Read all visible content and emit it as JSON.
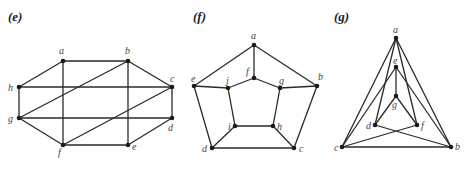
{
  "figures": [
    {
      "label": "(e)",
      "label_pos": [
        8,
        21
      ],
      "vertices": [
        {
          "id": "a",
          "x": 63,
          "y": 61,
          "lx": 59,
          "ly": 54
        },
        {
          "id": "b",
          "x": 128,
          "y": 61,
          "lx": 125,
          "ly": 54
        },
        {
          "id": "c",
          "x": 172,
          "y": 87,
          "lx": 170,
          "ly": 82
        },
        {
          "id": "d",
          "x": 172,
          "y": 118,
          "lx": 168,
          "ly": 131
        },
        {
          "id": "e",
          "x": 128,
          "y": 145,
          "lx": 132,
          "ly": 150
        },
        {
          "id": "f",
          "x": 63,
          "y": 145,
          "lx": 58,
          "ly": 156
        },
        {
          "id": "h",
          "x": 19,
          "y": 87,
          "lx": 8,
          "ly": 91
        },
        {
          "id": "g",
          "x": 19,
          "y": 118,
          "lx": 8,
          "ly": 122
        }
      ],
      "edges": [
        [
          "a",
          "b"
        ],
        [
          "a",
          "h"
        ],
        [
          "a",
          "f"
        ],
        [
          "b",
          "c"
        ],
        [
          "b",
          "e"
        ],
        [
          "b",
          "g"
        ],
        [
          "c",
          "h"
        ],
        [
          "c",
          "d"
        ],
        [
          "c",
          "f"
        ],
        [
          "d",
          "g"
        ],
        [
          "d",
          "e"
        ],
        [
          "e",
          "f"
        ],
        [
          "f",
          "g"
        ],
        [
          "g",
          "h"
        ]
      ]
    },
    {
      "label": "(f)",
      "label_pos": [
        193,
        21
      ],
      "vertices": [
        {
          "id": "a",
          "x": 254,
          "y": 45,
          "lx": 251,
          "ly": 39
        },
        {
          "id": "b",
          "x": 317,
          "y": 86,
          "lx": 318,
          "ly": 80
        },
        {
          "id": "c",
          "x": 294,
          "y": 148,
          "lx": 299,
          "ly": 152
        },
        {
          "id": "d",
          "x": 212,
          "y": 148,
          "lx": 202,
          "ly": 152
        },
        {
          "id": "e",
          "x": 194,
          "y": 86,
          "lx": 191,
          "ly": 82
        },
        {
          "id": "f",
          "x": 254,
          "y": 78,
          "lx": 246,
          "ly": 75
        },
        {
          "id": "g",
          "x": 280,
          "y": 88,
          "lx": 279,
          "ly": 84
        },
        {
          "id": "h",
          "x": 273,
          "y": 126,
          "lx": 277,
          "ly": 130
        },
        {
          "id": "i",
          "x": 235,
          "y": 126,
          "lx": 228,
          "ly": 130
        },
        {
          "id": "j",
          "x": 228,
          "y": 88,
          "lx": 226,
          "ly": 84
        }
      ],
      "edges": [
        [
          "a",
          "b"
        ],
        [
          "b",
          "c"
        ],
        [
          "c",
          "d"
        ],
        [
          "d",
          "e"
        ],
        [
          "e",
          "a"
        ],
        [
          "a",
          "f"
        ],
        [
          "b",
          "g"
        ],
        [
          "c",
          "h"
        ],
        [
          "d",
          "i"
        ],
        [
          "e",
          "j"
        ],
        [
          "f",
          "g"
        ],
        [
          "g",
          "h"
        ],
        [
          "h",
          "i"
        ],
        [
          "i",
          "j"
        ],
        [
          "j",
          "f"
        ]
      ]
    },
    {
      "label": "(g)",
      "label_pos": [
        334,
        21
      ],
      "vertices": [
        {
          "id": "a",
          "x": 396,
          "y": 38,
          "lx": 393,
          "ly": 33
        },
        {
          "id": "e",
          "x": 396,
          "y": 67,
          "lx": 393,
          "ly": 64
        },
        {
          "id": "g",
          "x": 396,
          "y": 96,
          "lx": 392,
          "ly": 108
        },
        {
          "id": "d",
          "x": 375,
          "y": 125,
          "lx": 366,
          "ly": 129
        },
        {
          "id": "f",
          "x": 417,
          "y": 125,
          "lx": 421,
          "ly": 129
        },
        {
          "id": "c",
          "x": 342,
          "y": 147,
          "lx": 334,
          "ly": 151
        },
        {
          "id": "b",
          "x": 451,
          "y": 147,
          "lx": 455,
          "ly": 150
        }
      ],
      "edges": [
        [
          "a",
          "c"
        ],
        [
          "a",
          "b"
        ],
        [
          "a",
          "d"
        ],
        [
          "a",
          "f"
        ],
        [
          "e",
          "g"
        ],
        [
          "e",
          "c"
        ],
        [
          "e",
          "b"
        ],
        [
          "g",
          "d"
        ],
        [
          "g",
          "f"
        ],
        [
          "d",
          "b"
        ],
        [
          "f",
          "c"
        ],
        [
          "c",
          "b"
        ]
      ]
    }
  ],
  "colors": {
    "edge": "#2a2a2a",
    "node": "#1a1a1a",
    "label": "#444444"
  }
}
